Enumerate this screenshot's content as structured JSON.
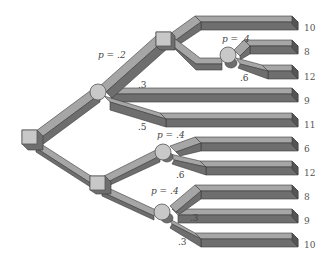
{
  "diagram": {
    "type": "decision-tree",
    "style": "3d-beveled-branches",
    "colors": {
      "background": "#ffffff",
      "branch_top": "#a6a6a6",
      "branch_side": "#6e6e6e",
      "branch_edge": "#3a3a3a",
      "node_fill": "#c8c8c8",
      "node_edge": "#555555",
      "text": "#444444"
    },
    "nodes": [
      {
        "id": "root",
        "kind": "decision",
        "shape": "square"
      },
      {
        "id": "chance-upper",
        "kind": "chance",
        "shape": "circle"
      },
      {
        "id": "decision-upper",
        "kind": "decision",
        "shape": "square"
      },
      {
        "id": "chance-upper-right",
        "kind": "chance",
        "shape": "circle"
      },
      {
        "id": "decision-lower",
        "kind": "decision",
        "shape": "square"
      },
      {
        "id": "chance-lower-1",
        "kind": "chance",
        "shape": "circle"
      },
      {
        "id": "chance-lower-2",
        "kind": "chance",
        "shape": "circle"
      }
    ],
    "labels": {
      "p_upper": "p = .2",
      "p_upper_3": ".3",
      "p_upper_5": ".5",
      "p_upper_right_4": "p = .4",
      "p_upper_right_6": ".6",
      "p_lower1_4": "p = .4",
      "p_lower1_6": ".6",
      "p_lower2_4": "p = .4",
      "p_lower2_3a": ".3",
      "p_lower2_3b": ".3"
    },
    "payoffs": [
      "10",
      "8",
      "12",
      "9",
      "11",
      "6",
      "12",
      "8",
      "9",
      "10"
    ]
  }
}
